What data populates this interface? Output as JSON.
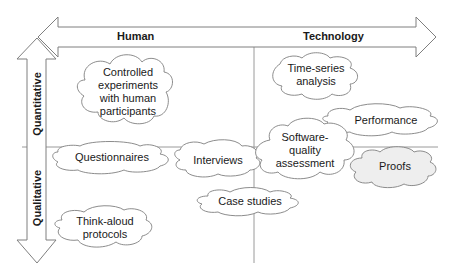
{
  "axes": {
    "horizontal": {
      "left": "Human",
      "right": "Technology"
    },
    "vertical": {
      "top": "Quantitative",
      "bottom": "Qualitative"
    }
  },
  "methods": [
    {
      "id": "controlled-experiments",
      "label": "Controlled experiments with human participants",
      "lines": [
        "Controlled",
        "experiments",
        "with human",
        "participants"
      ],
      "fill": "#ffffff"
    },
    {
      "id": "time-series",
      "label": "Time-series analysis",
      "lines": [
        "Time-series",
        "analysis"
      ],
      "fill": "#ffffff"
    },
    {
      "id": "performance",
      "label": "Performance",
      "lines": [
        "Performance"
      ],
      "fill": "#ffffff"
    },
    {
      "id": "questionnaires",
      "label": "Questionnaires",
      "lines": [
        "Questionnaires"
      ],
      "fill": "#ffffff"
    },
    {
      "id": "interviews",
      "label": "Interviews",
      "lines": [
        "Interviews"
      ],
      "fill": "#ffffff"
    },
    {
      "id": "software-quality",
      "label": "Software-quality assessment",
      "lines": [
        "Software-",
        "quality",
        "assessment"
      ],
      "fill": "#ffffff"
    },
    {
      "id": "proofs",
      "label": "Proofs",
      "lines": [
        "Proofs"
      ],
      "fill": "#eeeeee"
    },
    {
      "id": "case-studies",
      "label": "Case studies",
      "lines": [
        "Case studies"
      ],
      "fill": "#ffffff"
    },
    {
      "id": "think-aloud",
      "label": "Think-aloud protocols",
      "lines": [
        "Think-aloud",
        "protocols"
      ],
      "fill": "#ffffff"
    }
  ],
  "colors": {
    "stroke": "#7f7f7f",
    "text": "#1a1a1a",
    "proofs_fill": "#eeeeee"
  }
}
